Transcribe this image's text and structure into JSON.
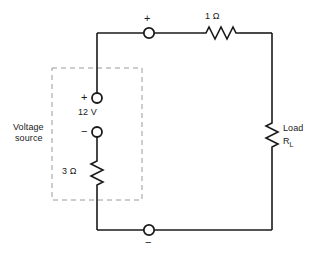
{
  "diagram": {
    "colors": {
      "wire": "#1a1a1a",
      "dashed_box": "#9a9a9a",
      "text": "#1a1a1a",
      "background": "#ffffff"
    },
    "labels": {
      "top_terminal_sign": "+",
      "bottom_terminal_sign": "−",
      "series_resistor": "1 Ω",
      "source_plus_sign": "+",
      "source_minus_sign": "−",
      "source_voltage": "12 V",
      "internal_resistor": "3 Ω",
      "enclosure_line1": "Voltage",
      "enclosure_line2": "source",
      "load_line1": "Load",
      "load_symbol_base": "R",
      "load_symbol_sub": "L"
    },
    "components": [
      {
        "name": "series-resistor",
        "value": "1 Ω",
        "orientation": "horizontal"
      },
      {
        "name": "internal-resistor",
        "value": "3 Ω",
        "orientation": "vertical"
      },
      {
        "name": "load-resistor",
        "value": "R_L",
        "orientation": "vertical"
      },
      {
        "name": "voltage-source",
        "value": "12 V",
        "orientation": "vertical"
      }
    ],
    "terminals": [
      {
        "name": "output-terminal-positive",
        "sign": "+"
      },
      {
        "name": "output-terminal-negative",
        "sign": "−"
      },
      {
        "name": "source-terminal-positive",
        "sign": "+"
      },
      {
        "name": "source-terminal-negative",
        "sign": "−"
      }
    ]
  }
}
